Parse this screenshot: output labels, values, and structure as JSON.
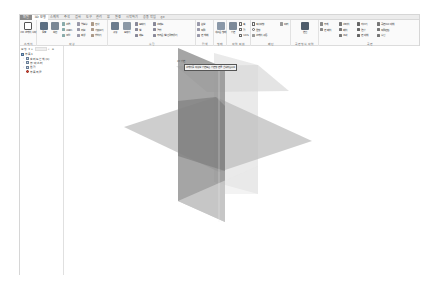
{
  "app": {
    "tabs": [
      {
        "label": "파일",
        "type": "file"
      },
      {
        "label": "3D 모형",
        "active": true
      },
      {
        "label": "스케치"
      },
      {
        "label": "주석"
      },
      {
        "label": "검사"
      },
      {
        "label": "도구"
      },
      {
        "label": "관리"
      },
      {
        "label": "뷰"
      },
      {
        "label": "환경"
      },
      {
        "label": "시작하기"
      },
      {
        "label": "공동 작업"
      },
      {
        "label": "◎▾"
      }
    ]
  },
  "ribbon": {
    "groups": [
      {
        "label": "스케치",
        "buttons": [
          {
            "label": "2D 스케치\n시작",
            "icon": "sketch-icon"
          }
        ]
      },
      {
        "label": "작성",
        "big": [
          {
            "label": "돌출",
            "icon": "extrude-icon"
          },
          {
            "label": "회전",
            "icon": "revolve-icon"
          }
        ],
        "small": [
          [
            "스윕",
            "로프트",
            "코일"
          ],
          [
            "엠보싱",
            "리브",
            "파생"
          ],
          [
            "전사",
            "가져오기",
            "합치기"
          ]
        ]
      },
      {
        "label": "수정",
        "big": [
          {
            "label": "구멍",
            "icon": "hole-icon"
          },
          {
            "label": "모깎기",
            "icon": "fillet-icon"
          }
        ],
        "small": [
          [
            "모따기",
            "쉘",
            "제도"
          ],
          [
            "스레드",
            "결합",
            "두꺼운 쉘/간격띄우기"
          ]
        ]
      },
      {
        "label": "탐색",
        "small": [
          [
            "분할",
            "직접",
            "면 삭제"
          ]
        ]
      },
      {
        "label": "형태",
        "big": [
          {
            "label": "새로운\n형태",
            "icon": "freeform-icon"
          }
        ]
      },
      {
        "label": "작업 피쳐",
        "big": [
          {
            "label": "평면",
            "icon": "plane-icon"
          }
        ],
        "small": [
          [
            "축",
            "점",
            "UCS"
          ]
        ]
      },
      {
        "label": "패턴",
        "small": [
          [
            "직사각형",
            "원형",
            "스케치 구동"
          ],
          [
            "미러"
          ]
        ]
      },
      {
        "label": "곡면 형식 작업",
        "big": [
          {
            "label": "변환",
            "icon": "convert-icon"
          }
        ]
      },
      {
        "label": "곡면",
        "small": [
          [
            "두께",
            "면 패치",
            ""
          ],
          [
            "스티치",
            "패치",
            "조각"
          ],
          [
            "자르기",
            "연장",
            "면 대체"
          ],
          [
            "곡면으로 대체",
            "직접편집",
            "수정"
          ]
        ]
      }
    ]
  },
  "browser": {
    "header": "모형",
    "tree": [
      {
        "label": "부품1",
        "icon": "part",
        "level": 0
      },
      {
        "label": "솔리드 본체(0)",
        "level": 1,
        "expander": "+"
      },
      {
        "label": "뷰: 마스터",
        "level": 1,
        "expander": "+"
      },
      {
        "label": "원점",
        "level": 1,
        "expander": "+"
      },
      {
        "label": "부품의 끝",
        "icon": "eop",
        "level": 1
      }
    ]
  },
  "viewport": {
    "plane_label": "XY 평면",
    "tooltip": "스케치를 작성할 평면 또는 평면형 면을 선택하십시오"
  }
}
